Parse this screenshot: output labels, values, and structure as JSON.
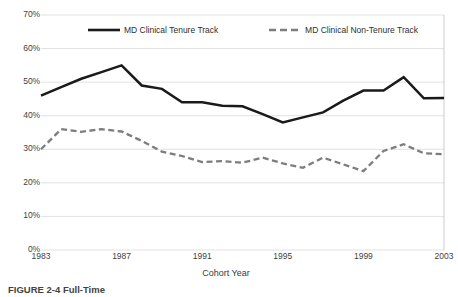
{
  "chart_data": {
    "type": "line",
    "title": "",
    "xlabel": "Cohort Year",
    "ylabel": "",
    "x": [
      1983,
      1984,
      1985,
      1986,
      1987,
      1988,
      1989,
      1990,
      1991,
      1992,
      1993,
      1994,
      1995,
      1996,
      1997,
      1998,
      1999,
      2000,
      2001,
      2002,
      2003
    ],
    "xlim": [
      1983,
      2003
    ],
    "ylim": [
      0,
      70
    ],
    "y_tick_labels": [
      "70%",
      "60%",
      "50%",
      "40%",
      "30%",
      "20%",
      "10%",
      "0%"
    ],
    "y_tick_values": [
      70,
      60,
      50,
      40,
      30,
      20,
      10,
      0
    ],
    "x_tick_labels": [
      "1983",
      "1987",
      "1991",
      "1995",
      "1999",
      "2003"
    ],
    "x_tick_values": [
      1983,
      1987,
      1991,
      1995,
      1999,
      2003
    ],
    "grid": "horizontal",
    "legend_position": "top-inside",
    "series": [
      {
        "name": "MD  Clinical Tenure Track",
        "style": "solid",
        "color": "#1a1a1a",
        "values": [
          46.0,
          48.5,
          51.0,
          53.0,
          55.0,
          49.0,
          48.0,
          44.0,
          44.0,
          43.0,
          42.8,
          40.5,
          38.0,
          39.5,
          41.0,
          44.5,
          47.5,
          47.5,
          51.5,
          45.2,
          45.3
        ]
      },
      {
        "name": "MD  Clinical Non-Tenure Track",
        "style": "dashed",
        "color": "#7d7d7d",
        "values": [
          30.0,
          36.0,
          35.2,
          36.0,
          35.3,
          32.5,
          29.3,
          28.0,
          26.2,
          26.5,
          26.0,
          27.5,
          25.8,
          24.5,
          27.5,
          25.5,
          23.5,
          29.5,
          31.5,
          28.8,
          28.5
        ]
      }
    ]
  },
  "legend": {
    "entries": [
      {
        "label": "MD  Clinical Tenure Track",
        "style": "solid"
      },
      {
        "label": "MD  Clinical Non-Tenure Track",
        "style": "dashed"
      }
    ]
  },
  "axis": {
    "x_title": "Cohort Year"
  },
  "caption": {
    "text": "FIGURE 2-4  Full-Time"
  },
  "colors": {
    "series_solid": "#1a1a1a",
    "series_dashed": "#7d7d7d",
    "gridline": "#d9d9d9",
    "axis_line": "#bfbfbf",
    "text": "#3a3a3a",
    "background": "#ffffff"
  }
}
